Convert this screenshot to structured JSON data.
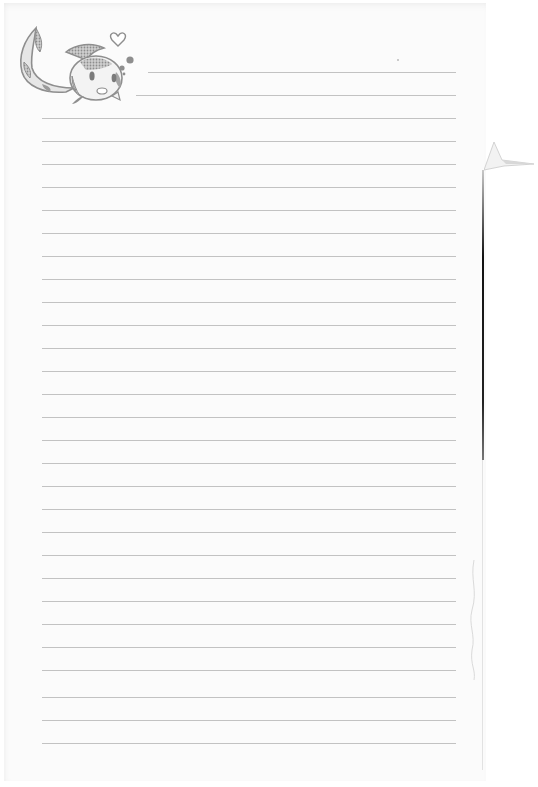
{
  "document": {
    "type": "lined stationery sheet",
    "background_color": "#fbfbfb",
    "rule_color": "#c2c2c2",
    "rule_spacing_px": 23,
    "rules": [
      {
        "y": 72,
        "x1": 148,
        "x2": 456
      },
      {
        "y": 95,
        "x1": 136,
        "x2": 456
      },
      {
        "y": 118,
        "x1": 42,
        "x2": 456
      },
      {
        "y": 141,
        "x1": 42,
        "x2": 456
      },
      {
        "y": 164,
        "x1": 42,
        "x2": 456
      },
      {
        "y": 187,
        "x1": 42,
        "x2": 456
      },
      {
        "y": 210,
        "x1": 42,
        "x2": 456
      },
      {
        "y": 233,
        "x1": 42,
        "x2": 456
      },
      {
        "y": 256,
        "x1": 42,
        "x2": 456
      },
      {
        "y": 279,
        "x1": 42,
        "x2": 456
      },
      {
        "y": 302,
        "x1": 42,
        "x2": 456
      },
      {
        "y": 325,
        "x1": 42,
        "x2": 456
      },
      {
        "y": 348,
        "x1": 42,
        "x2": 456
      },
      {
        "y": 371,
        "x1": 42,
        "x2": 456
      },
      {
        "y": 394,
        "x1": 42,
        "x2": 456
      },
      {
        "y": 417,
        "x1": 42,
        "x2": 456
      },
      {
        "y": 440,
        "x1": 42,
        "x2": 456
      },
      {
        "y": 463,
        "x1": 42,
        "x2": 456
      },
      {
        "y": 486,
        "x1": 42,
        "x2": 456
      },
      {
        "y": 509,
        "x1": 42,
        "x2": 456
      },
      {
        "y": 532,
        "x1": 42,
        "x2": 456
      },
      {
        "y": 555,
        "x1": 42,
        "x2": 456
      },
      {
        "y": 578,
        "x1": 42,
        "x2": 456
      },
      {
        "y": 601,
        "x1": 42,
        "x2": 456
      },
      {
        "y": 624,
        "x1": 42,
        "x2": 456
      },
      {
        "y": 647,
        "x1": 42,
        "x2": 456
      },
      {
        "y": 670,
        "x1": 42,
        "x2": 456
      },
      {
        "y": 697,
        "x1": 42,
        "x2": 456
      },
      {
        "y": 720,
        "x1": 42,
        "x2": 456
      },
      {
        "y": 743,
        "x1": 42,
        "x2": 456
      }
    ],
    "illustration": {
      "subject": "cartoon fish mascot with heart and bubbles",
      "icons": [
        "fish-icon",
        "heart-icon",
        "bubbles-icon"
      ],
      "color": "#9a9a9a"
    },
    "text_content": ""
  }
}
